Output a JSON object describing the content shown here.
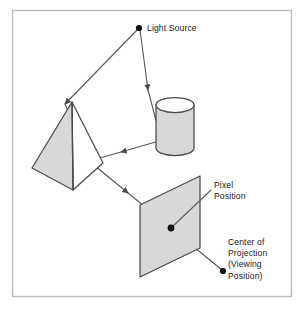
{
  "figure": {
    "name": "ray-tracing-illustration",
    "background_color": "#ffffff",
    "frame": {
      "name": "figure-border",
      "stroke_color": "#b9b9b9",
      "x": 12,
      "y": 10,
      "width": 280,
      "height": 287
    },
    "palette": {
      "line": "#4a4a4a",
      "fill_gray": "#d8d8d8",
      "fill_white": "#ffffff",
      "dot": "#111111",
      "text": "#1a1a1a"
    },
    "labels": [
      {
        "id": "light-source",
        "lines": [
          "Light Source"
        ],
        "x": 147,
        "y": 31
      },
      {
        "id": "pixel-position",
        "lines": [
          "Pixel",
          "Position"
        ],
        "x": 214,
        "y": 188
      },
      {
        "id": "center-of-projection",
        "lines": [
          "Center of",
          "Projection",
          "(Viewing",
          "Position)"
        ],
        "x": 228,
        "y": 245
      }
    ],
    "points": [
      {
        "id": "light-source-point",
        "x": 139,
        "y": 28,
        "r": 3.1
      },
      {
        "id": "pixel-position-point",
        "x": 171,
        "y": 228,
        "r": 3.4
      },
      {
        "id": "center-of-projection-point",
        "x": 223,
        "y": 271,
        "r": 3.1
      }
    ],
    "objects": [
      {
        "id": "pyramid",
        "shape": "triangular-pyramid",
        "faces": [
          {
            "id": "pyramid-left-face",
            "points": "72,102 32,168 73,190",
            "fill": "#d8d8d8"
          },
          {
            "id": "pyramid-right-face",
            "points": "72,102 103,163 73,190",
            "fill": "#ffffff"
          }
        ]
      },
      {
        "id": "cylinder",
        "shape": "cylinder",
        "body": {
          "id": "cylinder-body",
          "x": 156,
          "y": 105,
          "width": 38,
          "height": 45,
          "fill": "#d8d8d8"
        },
        "top": {
          "id": "cylinder-top-ellipse",
          "cx": 175,
          "cy": 105,
          "rx": 19,
          "ry": 7.5,
          "fill": "#ffffff"
        }
      },
      {
        "id": "projection-plane",
        "shape": "parallelogram",
        "points": "200,176 200,248 140,277 140,205",
        "fill": "#d8d8d8"
      }
    ],
    "rays": [
      {
        "id": "ray-cop-to-pixel",
        "from": "center-of-projection-point",
        "to": "pixel-position-point",
        "arrow": false
      },
      {
        "id": "ray-pixel-to-pyramid",
        "from": "pixel-position-point",
        "to": "pyramid",
        "arrow": true,
        "direction": "toward-pyramid"
      },
      {
        "id": "ray-pyramid-to-light",
        "from": "pyramid",
        "to": "light-source-point",
        "arrow": true,
        "direction": "toward-light"
      },
      {
        "id": "ray-pyramid-to-cylinder",
        "from": "pyramid",
        "to": "cylinder",
        "arrow": true,
        "direction": "toward-cylinder"
      },
      {
        "id": "ray-cylinder-to-light",
        "from": "cylinder",
        "to": "light-source-point",
        "arrow": true,
        "direction": "toward-light"
      }
    ],
    "leaders": [
      {
        "id": "leader-pixel-position",
        "from": "pixel-position-point",
        "to_label": "pixel-position"
      }
    ]
  }
}
